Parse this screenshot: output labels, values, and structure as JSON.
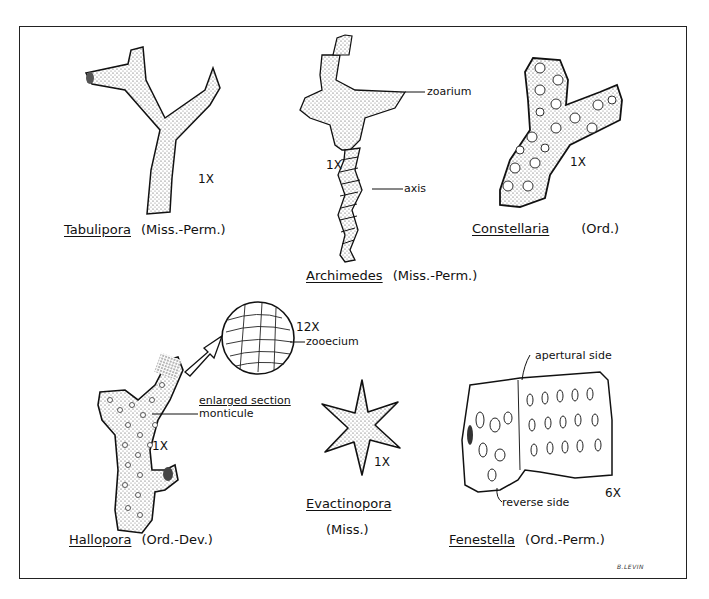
{
  "figure": {
    "signature": "B.LEVIN",
    "specimens": [
      {
        "id": "tabulipora",
        "genus": "Tabulipora",
        "range": "(Miss.-Perm.)",
        "magnification": "1X"
      },
      {
        "id": "archimedes",
        "genus": "Archimedes",
        "range": "(Miss.-Perm.)",
        "magnification": "1X",
        "annotations": [
          "zoarium",
          "axis"
        ]
      },
      {
        "id": "constellaria",
        "genus": "Constellaria",
        "range": "(Ord.)",
        "magnification": "1X"
      },
      {
        "id": "hallopora",
        "genus": "Hallopora",
        "range": "(Ord.-Dev.)",
        "magnification": "1X",
        "annotations": [
          "monticule",
          "enlarged section",
          "zooecium"
        ],
        "inset_magnification": "12X"
      },
      {
        "id": "evactinopora",
        "genus": "Evactinopora",
        "range": "(Miss.)",
        "magnification": "1X"
      },
      {
        "id": "fenestella",
        "genus": "Fenestella",
        "range": "(Ord.-Perm.)",
        "magnification": "6X",
        "annotations": [
          "apertural side",
          "reverse side"
        ]
      }
    ]
  }
}
